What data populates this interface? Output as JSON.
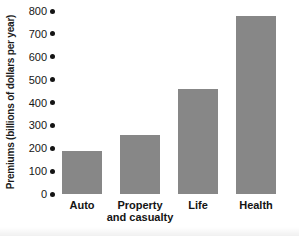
{
  "chart_data": {
    "type": "bar",
    "title": "",
    "categories": [
      "Auto",
      "Property\nand casualty",
      "Life",
      "Health"
    ],
    "values": [
      190,
      260,
      460,
      780
    ],
    "xlabel": "",
    "ylabel": "Premiums (billions of dollars per year)",
    "ylim": [
      0,
      800
    ],
    "yticks": [
      0,
      100,
      200,
      300,
      400,
      500,
      600,
      700,
      800
    ],
    "grid": false,
    "legend": null,
    "tick_marker": "filled-dot",
    "colors": {
      "bar": "#878787",
      "text": "#161616",
      "tick_dot": "#141414",
      "background": "#ffffff"
    }
  }
}
